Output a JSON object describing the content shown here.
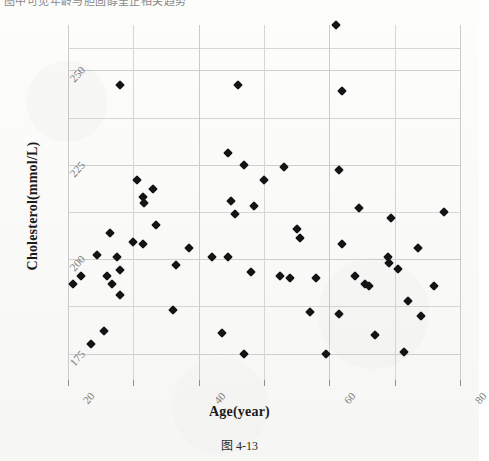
{
  "page": {
    "top_partial_text": "图中可见年龄与胆固醇呈正相关趋势",
    "caption": "图 4-13"
  },
  "chart_data": {
    "type": "scatter",
    "title": "",
    "xlabel": "Age(year)",
    "ylabel": "Cholesterol(mmol/L)",
    "xlim": [
      20,
      80
    ],
    "ylim": [
      168,
      262
    ],
    "xticks": [
      20,
      40,
      60,
      80
    ],
    "yticks": [
      175,
      200,
      225,
      250
    ],
    "xtick_labels": [
      "20",
      "40",
      "60",
      "80"
    ],
    "ytick_labels": [
      "175",
      "200",
      "225",
      "250"
    ],
    "grid": true,
    "grid_minor_x": [
      30,
      50,
      70
    ],
    "grid_minor_y": [
      187.5,
      212.5,
      237.5,
      250,
      256
    ],
    "legend": null,
    "marker": "diamond",
    "marker_color": "#141414",
    "n_points": 62,
    "points": [
      {
        "x": 28.0,
        "y": 246.0
      },
      {
        "x": 46.0,
        "y": 246.0
      },
      {
        "x": 62.0,
        "y": 244.5
      },
      {
        "x": 61.0,
        "y": 262.0
      },
      {
        "x": 44.5,
        "y": 228.0
      },
      {
        "x": 47.0,
        "y": 225.0
      },
      {
        "x": 53.0,
        "y": 224.5
      },
      {
        "x": 61.5,
        "y": 223.5
      },
      {
        "x": 30.5,
        "y": 221.0
      },
      {
        "x": 33.0,
        "y": 218.5
      },
      {
        "x": 31.5,
        "y": 216.5
      },
      {
        "x": 31.7,
        "y": 215.0
      },
      {
        "x": 45.0,
        "y": 215.5
      },
      {
        "x": 48.5,
        "y": 214.0
      },
      {
        "x": 45.5,
        "y": 212.0
      },
      {
        "x": 64.5,
        "y": 213.5
      },
      {
        "x": 77.5,
        "y": 212.5
      },
      {
        "x": 69.5,
        "y": 211.0
      },
      {
        "x": 26.5,
        "y": 207.0
      },
      {
        "x": 30.0,
        "y": 204.5
      },
      {
        "x": 31.5,
        "y": 204.0
      },
      {
        "x": 38.5,
        "y": 203.0
      },
      {
        "x": 55.5,
        "y": 205.5
      },
      {
        "x": 73.5,
        "y": 203.0
      },
      {
        "x": 24.5,
        "y": 201.0
      },
      {
        "x": 27.5,
        "y": 200.5
      },
      {
        "x": 42.0,
        "y": 200.5
      },
      {
        "x": 44.5,
        "y": 200.5
      },
      {
        "x": 69.0,
        "y": 200.5
      },
      {
        "x": 69.2,
        "y": 199.0
      },
      {
        "x": 70.5,
        "y": 197.5
      },
      {
        "x": 22.0,
        "y": 195.5
      },
      {
        "x": 26.0,
        "y": 195.5
      },
      {
        "x": 28.0,
        "y": 197.0
      },
      {
        "x": 48.0,
        "y": 196.5
      },
      {
        "x": 52.5,
        "y": 195.5
      },
      {
        "x": 54.0,
        "y": 195.0
      },
      {
        "x": 58.0,
        "y": 195.0
      },
      {
        "x": 64.0,
        "y": 195.5
      },
      {
        "x": 20.8,
        "y": 193.5
      },
      {
        "x": 26.8,
        "y": 193.5
      },
      {
        "x": 65.5,
        "y": 193.5
      },
      {
        "x": 66.0,
        "y": 193.0
      },
      {
        "x": 76.0,
        "y": 193.0
      },
      {
        "x": 28.0,
        "y": 190.5
      },
      {
        "x": 72.0,
        "y": 189.0
      },
      {
        "x": 36.0,
        "y": 186.5
      },
      {
        "x": 57.0,
        "y": 186.0
      },
      {
        "x": 61.5,
        "y": 185.5
      },
      {
        "x": 74.0,
        "y": 185.0
      },
      {
        "x": 25.5,
        "y": 181.0
      },
      {
        "x": 43.5,
        "y": 180.5
      },
      {
        "x": 67.0,
        "y": 180.0
      },
      {
        "x": 23.5,
        "y": 177.5
      },
      {
        "x": 47.0,
        "y": 175.0
      },
      {
        "x": 59.5,
        "y": 175.0
      },
      {
        "x": 71.5,
        "y": 175.5
      },
      {
        "x": 36.5,
        "y": 198.5
      },
      {
        "x": 50.0,
        "y": 221.0
      },
      {
        "x": 62.0,
        "y": 204.0
      },
      {
        "x": 55.0,
        "y": 208.0
      },
      {
        "x": 33.5,
        "y": 209.0
      }
    ]
  }
}
